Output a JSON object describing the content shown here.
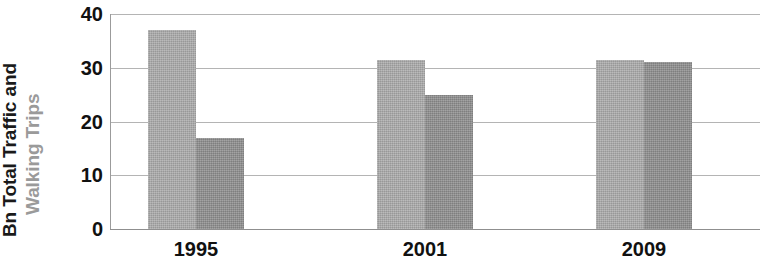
{
  "chart_data": {
    "type": "bar",
    "title": "",
    "subtitle": "",
    "xlabel": "",
    "ylabel_line1": "Bn Total Traffic and",
    "ylabel_line2": "Walking Trips",
    "ylabel": "Bn Total Traffic and Walking Trips",
    "categories": [
      "1995",
      "2001",
      "2009"
    ],
    "series": [
      {
        "name": "Total Traffic",
        "color": "#ababab",
        "values": [
          37,
          31.5,
          31.5
        ]
      },
      {
        "name": "Walking Trips",
        "color": "#8e8e8e",
        "values": [
          17,
          25,
          31
        ]
      }
    ],
    "ylim": [
      0,
      40
    ],
    "yticks": [
      0,
      10,
      20,
      30,
      40
    ],
    "ytick_labels": [
      "0",
      "10",
      "20",
      "30",
      "40"
    ],
    "grid": true,
    "grid_axis": "y",
    "legend": false,
    "legend_position": "none"
  },
  "style": {
    "background": "#ffffff",
    "gridline_color": "#b4b4b4",
    "axis_color": "#8f8f8f",
    "tick_text_color": "#111111",
    "ylabel_line1_color": "#1a1a1a",
    "ylabel_line2_color": "#9a9a9a"
  }
}
